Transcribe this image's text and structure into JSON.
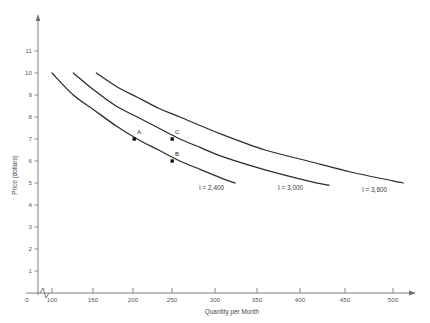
{
  "chart_data": {
    "type": "line",
    "title": "",
    "xlabel": "Quantity per Month",
    "ylabel": "Price (dollars)",
    "xlim": [
      0,
      520
    ],
    "ylim": [
      0,
      11.8
    ],
    "grid": false,
    "legend_position": "inline-curve-end-labels",
    "x_ticks": [
      "0",
      "100",
      "150",
      "200",
      "250",
      "300",
      "350",
      "400",
      "450",
      "500"
    ],
    "y_ticks": [
      "1",
      "2",
      "3",
      "4",
      "5",
      "6",
      "7",
      "8",
      "9",
      "10",
      "11"
    ],
    "axis_break_on_x": true,
    "series": [
      {
        "name": "I = 2,400",
        "label_text": "I = 2,400",
        "income": 2400,
        "points": [
          {
            "q": 100,
            "p": 10.0
          },
          {
            "q": 125,
            "p": 9.0
          },
          {
            "q": 150,
            "p": 8.3
          },
          {
            "q": 175,
            "p": 7.6
          },
          {
            "q": 200,
            "p": 7.0
          },
          {
            "q": 225,
            "p": 6.5
          },
          {
            "q": 250,
            "p": 6.0
          },
          {
            "q": 275,
            "p": 5.6
          },
          {
            "q": 300,
            "p": 5.2
          },
          {
            "q": 315,
            "p": 5.0
          }
        ]
      },
      {
        "name": "I = 3,000",
        "label_text": "I = 3,000",
        "income": 3000,
        "points": [
          {
            "q": 125,
            "p": 10.0
          },
          {
            "q": 150,
            "p": 9.2
          },
          {
            "q": 175,
            "p": 8.5
          },
          {
            "q": 200,
            "p": 8.0
          },
          {
            "q": 225,
            "p": 7.5
          },
          {
            "q": 250,
            "p": 7.0
          },
          {
            "q": 275,
            "p": 6.6
          },
          {
            "q": 300,
            "p": 6.2
          },
          {
            "q": 350,
            "p": 5.6
          },
          {
            "q": 400,
            "p": 5.1
          },
          {
            "q": 425,
            "p": 4.9
          }
        ]
      },
      {
        "name": "I = 3,600",
        "label_text": "I = 3,600",
        "income": 3600,
        "points": [
          {
            "q": 152,
            "p": 10.0
          },
          {
            "q": 175,
            "p": 9.4
          },
          {
            "q": 200,
            "p": 8.9
          },
          {
            "q": 225,
            "p": 8.4
          },
          {
            "q": 250,
            "p": 8.0
          },
          {
            "q": 300,
            "p": 7.2
          },
          {
            "q": 350,
            "p": 6.5
          },
          {
            "q": 400,
            "p": 6.0
          },
          {
            "q": 450,
            "p": 5.5
          },
          {
            "q": 500,
            "p": 5.1
          },
          {
            "q": 512,
            "p": 5.0
          }
        ]
      }
    ],
    "annotations": [
      {
        "label": "A",
        "q": 200,
        "p": 7,
        "on_series": "I = 2,400"
      },
      {
        "label": "B",
        "q": 250,
        "p": 6,
        "on_series": "I = 2,400"
      },
      {
        "label": "C",
        "q": 250,
        "p": 7,
        "on_series": "I = 3,000"
      }
    ]
  },
  "colors": {
    "curve": "#2b2b2b",
    "axis": "#6f6f6f",
    "text": "#3a3a3a",
    "background": "#ffffff"
  }
}
